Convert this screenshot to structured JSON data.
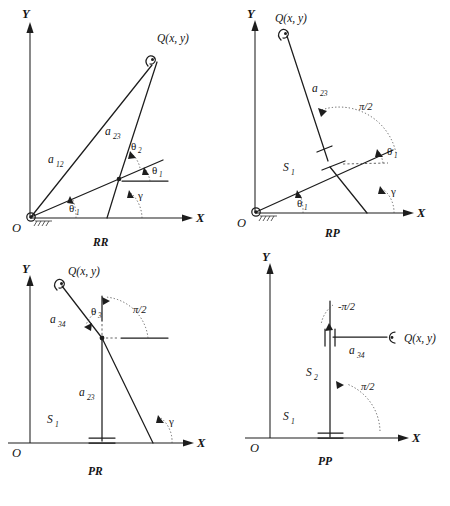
{
  "figure": {
    "background_color": "#ffffff",
    "ink_color": "#1d1d1d"
  },
  "common": {
    "axis_x": "X",
    "axis_y": "Y",
    "origin": "O",
    "point_q": "Q(x, y)",
    "theta": "θ",
    "gamma": "γ",
    "pi_over_2": "π/2",
    "neg_pi_over_2": "-π/2"
  },
  "panels": [
    {
      "id": "RR",
      "name": "RR",
      "position": "top-left",
      "joints": [
        {
          "type": "revolute",
          "location": "origin",
          "grounded": true
        },
        {
          "type": "revolute",
          "location": "elbow",
          "grounded": false
        },
        {
          "type": "revolute",
          "location": "end-effector",
          "grounded": false
        }
      ],
      "links": [
        {
          "label": "a",
          "subscript": "12",
          "text": "a₁₂"
        },
        {
          "label": "a",
          "subscript": "23",
          "text": "a₂₃"
        }
      ],
      "angles": [
        {
          "symbol": "θ",
          "subscript": "1",
          "location": "at-origin"
        },
        {
          "symbol": "θ",
          "subscript": "1",
          "location": "at-elbow"
        },
        {
          "symbol": "θ",
          "subscript": "2",
          "location": "at-elbow-upper"
        },
        {
          "symbol": "γ",
          "subscript": "",
          "location": "at-x-axis"
        }
      ],
      "endpoint": "Q(x, y)"
    },
    {
      "id": "RP",
      "name": "RP",
      "position": "top-right",
      "joints": [
        {
          "type": "revolute",
          "location": "origin",
          "grounded": true
        },
        {
          "type": "prismatic",
          "location": "slider",
          "grounded": false
        },
        {
          "type": "revolute",
          "location": "end-effector",
          "grounded": false
        }
      ],
      "links": [
        {
          "label": "S",
          "subscript": "1",
          "text": "S₁"
        },
        {
          "label": "a",
          "subscript": "23",
          "text": "a₂₃"
        }
      ],
      "angles": [
        {
          "symbol": "θ",
          "subscript": "1",
          "location": "at-origin"
        },
        {
          "symbol": "θ",
          "subscript": "1",
          "location": "at-slider"
        },
        {
          "symbol": "π/2",
          "subscript": "",
          "location": "at-slider-upper"
        },
        {
          "symbol": "γ",
          "subscript": "",
          "location": "at-x-axis"
        }
      ],
      "endpoint": "Q(x, y)"
    },
    {
      "id": "PR",
      "name": "PR",
      "position": "bottom-left",
      "joints": [
        {
          "type": "prismatic",
          "location": "base-on-x-axis",
          "grounded": true
        },
        {
          "type": "revolute",
          "location": "elbow",
          "grounded": false
        },
        {
          "type": "revolute",
          "location": "end-effector",
          "grounded": false
        }
      ],
      "links": [
        {
          "label": "S",
          "subscript": "1",
          "text": "S₁"
        },
        {
          "label": "a",
          "subscript": "23",
          "text": "a₂₃"
        },
        {
          "label": "a",
          "subscript": "34",
          "text": "a₃₄"
        }
      ],
      "angles": [
        {
          "symbol": "θ",
          "subscript": "3",
          "location": "at-elbow"
        },
        {
          "symbol": "π/2",
          "subscript": "",
          "location": "at-elbow-right"
        },
        {
          "symbol": "γ",
          "subscript": "",
          "location": "at-x-axis"
        }
      ],
      "endpoint": "Q(x, y)"
    },
    {
      "id": "PP",
      "name": "PP",
      "position": "bottom-right",
      "joints": [
        {
          "type": "prismatic",
          "location": "base-on-x-axis",
          "grounded": true
        },
        {
          "type": "prismatic",
          "location": "upper-slider",
          "grounded": false
        },
        {
          "type": "revolute",
          "location": "end-effector",
          "grounded": false
        }
      ],
      "links": [
        {
          "label": "S",
          "subscript": "1",
          "text": "S₁"
        },
        {
          "label": "S",
          "subscript": "2",
          "text": "S₂"
        },
        {
          "label": "a",
          "subscript": "34",
          "text": "a₃₄"
        }
      ],
      "angles": [
        {
          "symbol": "-π/2",
          "subscript": "",
          "location": "at-upper-slider"
        },
        {
          "symbol": "π/2",
          "subscript": "",
          "location": "at-base"
        }
      ],
      "endpoint": "Q(x, y)"
    }
  ],
  "labels": {
    "rr": {
      "name": "RR",
      "q": "Q(x, y)",
      "a12": "a",
      "a12_sub": "12",
      "a23": "a",
      "a23_sub": "23",
      "theta1_origin": "θ",
      "theta1_origin_sub": "1",
      "theta1_elbow": "θ",
      "theta1_elbow_sub": "1",
      "theta2": "θ",
      "theta2_sub": "2",
      "gamma": "γ",
      "x": "X",
      "y": "Y",
      "o": "O"
    },
    "rp": {
      "name": "RP",
      "q": "Q(x, y)",
      "a23": "a",
      "a23_sub": "23",
      "s1": "S",
      "s1_sub": "1",
      "theta1_origin": "θ",
      "theta1_origin_sub": "1",
      "theta1_slider": "θ",
      "theta1_slider_sub": "1",
      "pi2": "π/2",
      "gamma": "γ",
      "x": "X",
      "y": "Y",
      "o": "O"
    },
    "pr": {
      "name": "PR",
      "q": "Q(x, y)",
      "a34": "a",
      "a34_sub": "34",
      "a23": "a",
      "a23_sub": "23",
      "s1": "S",
      "s1_sub": "1",
      "theta3": "θ",
      "theta3_sub": "3",
      "pi2": "π/2",
      "gamma": "γ",
      "x": "X",
      "y": "Y",
      "o": "O"
    },
    "pp": {
      "name": "PP",
      "q": "Q(x, y)",
      "a34": "a",
      "a34_sub": "34",
      "s1": "S",
      "s1_sub": "1",
      "s2": "S",
      "s2_sub": "2",
      "neg_pi2": "-π/2",
      "pi2": "π/2",
      "x": "X",
      "y": "Y",
      "o": "O"
    }
  }
}
